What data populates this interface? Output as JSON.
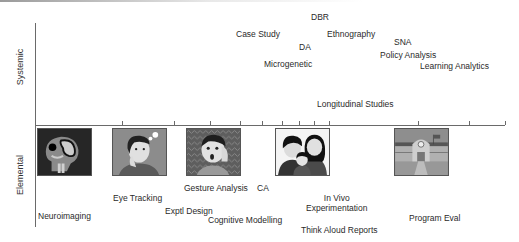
{
  "diagram": {
    "axes": {
      "vertical_top_label": "Systemic",
      "vertical_bottom_label": "Elemental"
    },
    "systemic_methods": [
      {
        "label": "DBR",
        "x": 311,
        "y": 12
      },
      {
        "label": "Case Study",
        "x": 236,
        "y": 29
      },
      {
        "label": "Ethnography",
        "x": 327,
        "y": 29
      },
      {
        "label": "SNA",
        "x": 394,
        "y": 37
      },
      {
        "label": "DA",
        "x": 299,
        "y": 42
      },
      {
        "label": "Policy Analysis",
        "x": 380,
        "y": 50
      },
      {
        "label": "Microgenetic",
        "x": 264,
        "y": 59
      },
      {
        "label": "Learning Analytics",
        "x": 420,
        "y": 61
      },
      {
        "label": "Longitudinal Studies",
        "x": 317,
        "y": 99
      }
    ],
    "elemental_methods": [
      {
        "label": "Gesture Analysis",
        "x": 184,
        "y": 183
      },
      {
        "label": "CA",
        "x": 257,
        "y": 183
      },
      {
        "label": "Eye Tracking",
        "x": 113,
        "y": 193
      },
      {
        "label": "In Vivo\nExperimentation",
        "x": 306,
        "y": 193
      },
      {
        "label": "Exptl Design",
        "x": 165,
        "y": 206
      },
      {
        "label": "Neuroimaging",
        "x": 38,
        "y": 211
      },
      {
        "label": "Cognitive Modelling",
        "x": 208,
        "y": 215
      },
      {
        "label": "Program Eval",
        "x": 409,
        "y": 213
      },
      {
        "label": "Think Aloud Reports",
        "x": 301,
        "y": 225
      }
    ],
    "ticks_x": [
      122,
      174,
      210,
      240,
      262,
      282,
      299,
      314,
      329,
      418,
      469,
      505
    ],
    "images": [
      {
        "name": "brain-scan-image",
        "description": "brain scan",
        "x": 37
      },
      {
        "name": "thinking-person-image",
        "description": "person thinking",
        "x": 112
      },
      {
        "name": "surprised-person-image",
        "description": "surprised person",
        "x": 186
      },
      {
        "name": "family-image",
        "description": "family",
        "x": 275
      },
      {
        "name": "school-building-image",
        "description": "school building",
        "x": 394
      }
    ]
  }
}
